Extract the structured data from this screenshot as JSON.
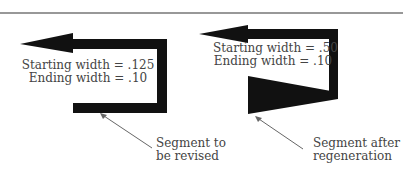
{
  "colors": {
    "shape_fill": "#111111",
    "rule": "#333333",
    "leader": "#666666",
    "text": "#444444",
    "background": "#ffffff"
  },
  "left_panel": {
    "caption_line1": "Starting width = .125",
    "caption_line2": "Ending width = .10",
    "callout_line1": "Segment to",
    "callout_line2": "be revised"
  },
  "right_panel": {
    "caption_line1": "Starting width = .50",
    "caption_line2": "Ending width = .10",
    "callout_line1": "Segment after",
    "callout_line2": "regeneration"
  }
}
